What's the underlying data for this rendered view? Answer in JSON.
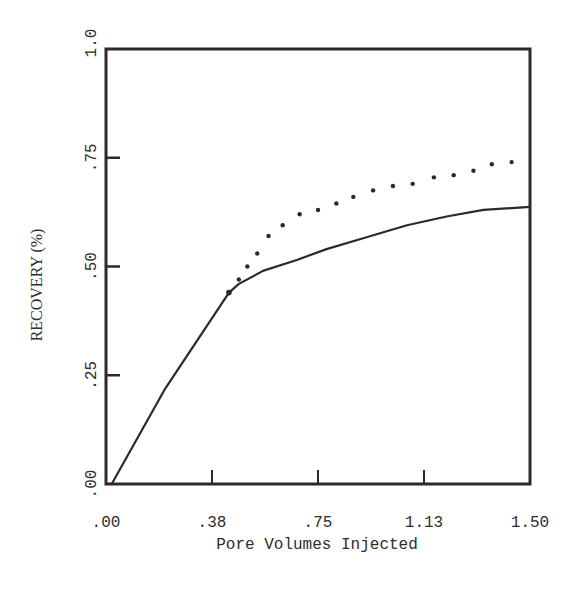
{
  "chart_data": {
    "type": "line",
    "title": "",
    "xlabel": "Pore Volumes Injected",
    "ylabel": "RECOVERY (%)",
    "xlim": [
      0,
      1.5
    ],
    "ylim": [
      0,
      1.0
    ],
    "grid": false,
    "legend": null,
    "x_ticks": [
      {
        "value": 0.0,
        "label": ".00"
      },
      {
        "value": 0.375,
        "label": ".38"
      },
      {
        "value": 0.75,
        "label": ".75"
      },
      {
        "value": 1.125,
        "label": "1.13"
      },
      {
        "value": 1.5,
        "label": "1.50"
      }
    ],
    "y_ticks": [
      {
        "value": 0.0,
        "label": ".00"
      },
      {
        "value": 0.25,
        "label": ".25"
      },
      {
        "value": 0.5,
        "label": ".50"
      },
      {
        "value": 0.75,
        "label": ".75"
      },
      {
        "value": 1.0,
        "label": "1.0"
      }
    ],
    "series": [
      {
        "name": "solid",
        "style": "solid",
        "x": [
          0.02,
          0.21,
          0.435,
          0.47,
          0.555,
          0.675,
          0.78,
          0.91,
          1.065,
          1.205,
          1.335,
          1.5
        ],
        "y": [
          0.0,
          0.22,
          0.44,
          0.46,
          0.49,
          0.515,
          0.54,
          0.565,
          0.595,
          0.615,
          0.63,
          0.637
        ]
      },
      {
        "name": "dotted",
        "style": "dotted",
        "x": [
          0.435,
          0.47,
          0.5,
          0.535,
          0.575,
          0.625,
          0.685,
          0.75,
          0.815,
          0.875,
          0.945,
          1.015,
          1.085,
          1.16,
          1.23,
          1.3,
          1.365,
          1.435
        ],
        "y": [
          0.44,
          0.47,
          0.5,
          0.53,
          0.57,
          0.595,
          0.62,
          0.63,
          0.645,
          0.66,
          0.675,
          0.685,
          0.69,
          0.705,
          0.71,
          0.72,
          0.735,
          0.74
        ]
      }
    ]
  },
  "colors": {
    "ink": "#2a2a2a",
    "background": "#ffffff"
  }
}
